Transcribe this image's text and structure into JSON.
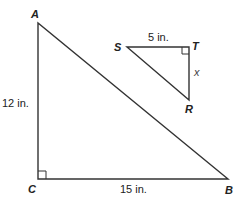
{
  "diagram": {
    "large_triangle": {
      "vertices": {
        "A": {
          "label": "A"
        },
        "B": {
          "label": "B"
        },
        "C": {
          "label": "C"
        }
      },
      "right_angle_at": "C",
      "sides": {
        "AC": {
          "label": "12 in."
        },
        "CB": {
          "label": "15 in."
        }
      }
    },
    "small_triangle": {
      "vertices": {
        "S": {
          "label": "S"
        },
        "T": {
          "label": "T"
        },
        "R": {
          "label": "R"
        }
      },
      "right_angle_at": "T",
      "sides": {
        "ST": {
          "label": "5 in."
        },
        "TR": {
          "label": "x"
        }
      }
    },
    "colors": {
      "line": "#333333",
      "text": "#222222",
      "background": "#ffffff"
    }
  }
}
